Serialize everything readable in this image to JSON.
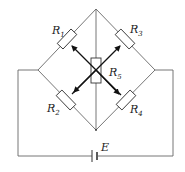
{
  "diagram": {
    "type": "wheatstone-bridge-circuit",
    "resistors": [
      {
        "id": "R1",
        "symbol": "R",
        "sub": "1",
        "position": "upper-left"
      },
      {
        "id": "R3",
        "symbol": "R",
        "sub": "3",
        "position": "upper-right"
      },
      {
        "id": "R2",
        "symbol": "R",
        "sub": "2",
        "position": "lower-left"
      },
      {
        "id": "R4",
        "symbol": "R",
        "sub": "4",
        "position": "lower-right"
      },
      {
        "id": "R5",
        "symbol": "R",
        "sub": "5",
        "position": "center-vertical"
      }
    ],
    "source": {
      "label": "E",
      "type": "battery"
    }
  }
}
